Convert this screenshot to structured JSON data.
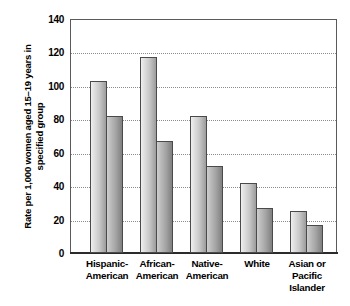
{
  "chart_data": {
    "type": "bar",
    "title": "",
    "xlabel": "",
    "ylabel": "Rate per 1,000 women aged 15–19 years in specified group",
    "ylabel_lines": [
      "Rate per 1,000 women aged",
      "15–19 years in specified group"
    ],
    "ylim": [
      0,
      140
    ],
    "yticks": [
      140,
      120,
      100,
      80,
      60,
      40,
      20,
      0
    ],
    "ytick_labels": [
      "140",
      "120",
      "100",
      "80",
      "60",
      "40",
      "20",
      "0"
    ],
    "grid": true,
    "legend": "none",
    "categories": [
      "Hispanic-American",
      "African-American",
      "Native-American",
      "White",
      "Asian or Pacific Islander"
    ],
    "category_lines": [
      [
        "Hispanic-",
        "American"
      ],
      [
        "African-",
        "American"
      ],
      [
        "Native-",
        "American"
      ],
      [
        "White"
      ],
      [
        "Asian or",
        "Pacific",
        "Islander"
      ]
    ],
    "series": [
      {
        "name": "series-1",
        "values": [
          103,
          117,
          82,
          42,
          25
        ]
      },
      {
        "name": "series-2",
        "values": [
          82,
          67,
          52,
          27,
          17
        ]
      }
    ],
    "colors": {
      "series_1_light": "#efefef",
      "series_1_dark": "#9c9c9c",
      "series_2_light": "#cfcfcf",
      "series_2_dark": "#808080",
      "bar_border": "#4a4a4a",
      "axis": "#5a5a5a",
      "baseline": "#2b2b2b",
      "gridline": "#8c8c8c",
      "text": "#000000",
      "background": "#ffffff"
    }
  }
}
